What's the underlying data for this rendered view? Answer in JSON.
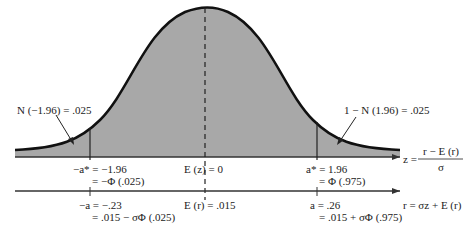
{
  "colors": {
    "fill": "#a8a8a8",
    "curve": "#111111",
    "axis": "#333333",
    "background": "#ffffff"
  },
  "labels": {
    "left_tail": "N (−1.96) = .025",
    "right_tail": "1 − N (1.96) = .025",
    "neg_astar_line1": "−a* = −1.96",
    "neg_astar_line2": "= −Φ (.025)",
    "ez": "E (z) = 0",
    "astar_line1": "a* = 1.96",
    "astar_line2": "= Φ (.975)",
    "z_formula_lhs": "z =",
    "z_formula_num": "r − E (r)",
    "z_formula_den": "σ",
    "neg_a_line1": "−a = −.23",
    "neg_a_line2": "= .015 − σΦ (.025)",
    "er": "E (r) = .015",
    "a_line1": "a = .26",
    "a_line2": "= .015 + σΦ (.975)",
    "r_formula": "r = σz + E (r)"
  }
}
